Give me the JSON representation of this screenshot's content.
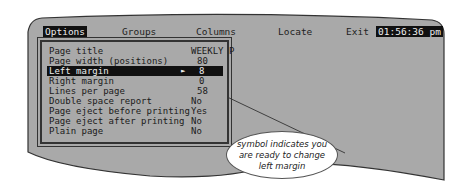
{
  "menubar": {
    "items": [
      {
        "label": "Options",
        "active": true
      },
      {
        "label": "Groups",
        "active": false
      },
      {
        "label": "Columns",
        "active": false
      },
      {
        "label": "Locate",
        "active": false
      },
      {
        "label": "Exit",
        "active": false
      }
    ],
    "clock": "01:56:36 pm"
  },
  "options_menu": {
    "rows": [
      {
        "label": "Page title",
        "value": "WEEKLY P",
        "selected": false
      },
      {
        "label": "Page width (positions)",
        "value": "80",
        "selected": false
      },
      {
        "label": "Left margin",
        "value": "8",
        "selected": true,
        "pointer": "►"
      },
      {
        "label": "Right margin",
        "value": "0",
        "selected": false
      },
      {
        "label": "Lines per page",
        "value": "58",
        "selected": false
      },
      {
        "label": "Double space report",
        "value": "No",
        "selected": false
      },
      {
        "label": "Page eject before printing",
        "value": "Yes",
        "selected": false
      },
      {
        "label": "Page eject after printing",
        "value": "No",
        "selected": false
      },
      {
        "label": "Plain page",
        "value": "No",
        "selected": false
      }
    ]
  },
  "callout": {
    "lines": [
      "symbol indicates you",
      "are ready to change",
      "left margin"
    ]
  },
  "colors": {
    "screen_bg": "#a9a9a9",
    "highlight_bg": "#111111",
    "highlight_fg": "#eeeeee"
  }
}
